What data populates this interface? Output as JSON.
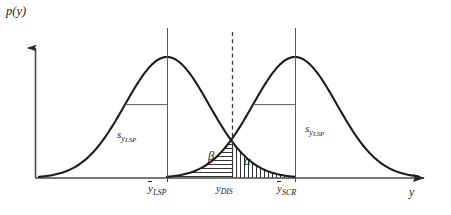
{
  "figure": {
    "type": "probability-density-diagram",
    "background_color": "#ffffff",
    "stroke_color": "#1c1c1c",
    "axis_color": "#4a4a4a"
  },
  "axes": {
    "y_axis_label": "p(y)",
    "x_axis_label": "y",
    "x_axis": {
      "x_start": 35,
      "x_end": 430,
      "y": 178,
      "arrow": true
    },
    "y_axis": {
      "x": 35,
      "y_start": 178,
      "y_end": 40,
      "arrow": true
    }
  },
  "curves": [
    {
      "name": "LSP distribution",
      "center_label": "y_LSP",
      "center_x": 167,
      "peak_y": 57,
      "baseline_y": 178,
      "sigma_px": 42,
      "sigma_label": "s",
      "sigma_subscript": "y",
      "sigma_subsubscript": "LSP"
    },
    {
      "name": "SCR distribution",
      "center_label": "y_SCR",
      "center_x": 295,
      "peak_y": 57,
      "baseline_y": 178,
      "sigma_px": 42,
      "sigma_label": "s",
      "sigma_subscript": "y",
      "sigma_subsubscript": "LSP"
    }
  ],
  "decision_line": {
    "label": "y_DIS",
    "x": 232,
    "style": "dashed",
    "y_top": 32,
    "y_bottom": 178
  },
  "regions": [
    {
      "name": "beta",
      "symbol": "β",
      "hatch": "horizontal",
      "description": "type II error area, right curve left tail, left of decision line"
    },
    {
      "name": "alpha",
      "symbol": "α",
      "hatch": "vertical",
      "description": "type I error area, left curve right tail, right of decision line"
    }
  ],
  "labels": {
    "p_of_y": "p(y)",
    "y_axis_name": "y",
    "sigma_left": {
      "base": "s",
      "sub": "y",
      "subsub": "LSP"
    },
    "sigma_right": {
      "base": "s",
      "sub": "y",
      "subsub": "LSP"
    },
    "beta": "β",
    "alpha": "α",
    "mean_lsp": {
      "base": "y",
      "sub": "LSP",
      "overline": true
    },
    "y_dis": {
      "base": "y",
      "sub": "DIS",
      "overline": false
    },
    "mean_scr": {
      "base": "y",
      "sub": "SCR",
      "overline": true
    }
  }
}
